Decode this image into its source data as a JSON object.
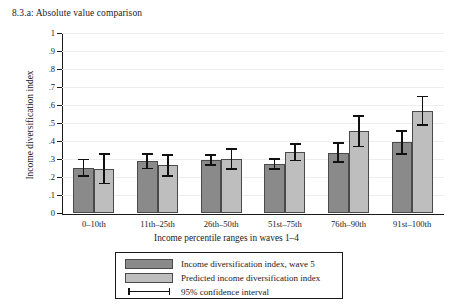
{
  "chart_data": {
    "type": "bar",
    "title": "8.3.a: Absolute value comparison",
    "xlabel": "Income percentile ranges in waves 1–4",
    "ylabel": "Income diversification index",
    "ylim": [
      0,
      1
    ],
    "ytick_labels": [
      "0",
      ".1",
      ".2",
      ".3",
      ".4",
      ".5",
      ".6",
      ".7",
      ".8",
      ".9",
      "1"
    ],
    "ytick_values": [
      0,
      0.1,
      0.2,
      0.3,
      0.4,
      0.5,
      0.6,
      0.7,
      0.8,
      0.9,
      1
    ],
    "grid": true,
    "legend_position": "below-axes",
    "categories": [
      "0–10th",
      "11th–25th",
      "26th–50th",
      "51st–75th",
      "76th–90th",
      "91st–100th"
    ],
    "series": [
      {
        "name": "Income diversification index, wave 5",
        "color": "#8a8a8a",
        "values": [
          0.25,
          0.288,
          0.295,
          0.272,
          0.335,
          0.392
        ],
        "ci_low": [
          0.205,
          0.248,
          0.268,
          0.243,
          0.282,
          0.327
        ],
        "ci_high": [
          0.298,
          0.327,
          0.323,
          0.301,
          0.39,
          0.454
        ]
      },
      {
        "name": "Predicted income diversification index",
        "color": "#bebebe",
        "values": [
          0.247,
          0.265,
          0.3,
          0.337,
          0.455,
          0.565
        ],
        "ci_low": [
          0.163,
          0.205,
          0.243,
          0.292,
          0.37,
          0.49
        ],
        "ci_high": [
          0.328,
          0.323,
          0.357,
          0.382,
          0.54,
          0.648
        ]
      }
    ],
    "ci_legend_label": "95% confidence interval"
  }
}
